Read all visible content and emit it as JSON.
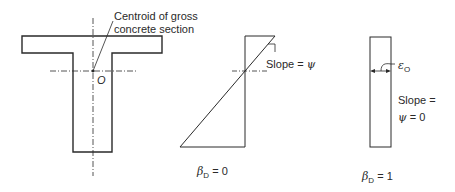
{
  "diagram": {
    "section": {
      "centroid_label_line1": "Centroid of gross",
      "centroid_label_line2": "concrete section",
      "origin_label": "O"
    },
    "case_beta0": {
      "slope_label": "Slope = ",
      "slope_symbol": "ψ",
      "beta_symbol": "β",
      "beta_subscript": "D",
      "beta_value": " = 0"
    },
    "case_beta1": {
      "strain_symbol": "ε",
      "strain_subscript": "O",
      "slope_line1": "Slope =",
      "slope_symbol": "ψ",
      "slope_value": " = 0",
      "beta_symbol": "β",
      "beta_subscript": "D",
      "beta_value": " = 1"
    },
    "colors": {
      "line": "#2a2a2a",
      "background": "#ffffff"
    }
  }
}
